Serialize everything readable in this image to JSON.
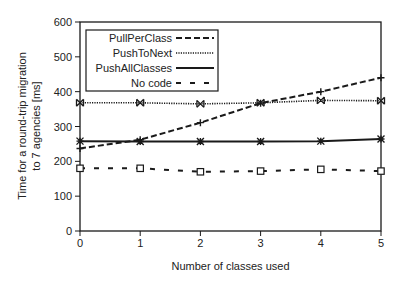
{
  "chart_data": {
    "type": "line",
    "title": "",
    "xlabel": "Number of classes used",
    "ylabel_lines": [
      "Time for a round-trip migration",
      "to 7 agencies [ms]"
    ],
    "ylabel": "Time for a round-trip migration to 7 agencies [ms]",
    "x": [
      0,
      1,
      2,
      3,
      4,
      5
    ],
    "xlim": [
      0,
      5
    ],
    "ylim": [
      0,
      600
    ],
    "xticks": [
      "0",
      "1",
      "2",
      "3",
      "4",
      "5"
    ],
    "yticks": [
      "0",
      "100",
      "200",
      "300",
      "400",
      "500",
      "600"
    ],
    "grid": false,
    "legend_position": "upper-left (inside)",
    "series": [
      {
        "name": "PullPerClass",
        "values": [
          237,
          262,
          311,
          367,
          400,
          440
        ],
        "line_style": "dashed",
        "marker": "plus"
      },
      {
        "name": "PushToNext",
        "values": [
          368,
          368,
          365,
          368,
          375,
          374
        ],
        "line_style": "dotted",
        "marker": "bowtie"
      },
      {
        "name": "PushAllClasses",
        "values": [
          258,
          257,
          257,
          257,
          258,
          264
        ],
        "line_style": "solid",
        "marker": "asterisk"
      },
      {
        "name": "No code",
        "values": [
          180,
          180,
          170,
          172,
          177,
          172
        ],
        "line_style": "sparse-dashed",
        "marker": "open-square"
      }
    ]
  },
  "colors": {
    "line": "#1a1a1a",
    "axis": "#1a1a1a",
    "background": "#ffffff"
  }
}
